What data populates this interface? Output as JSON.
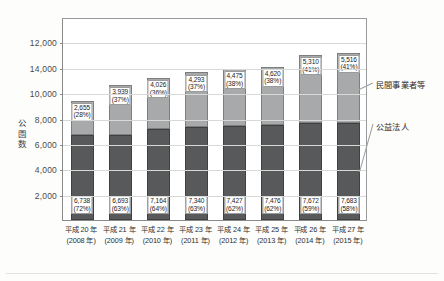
{
  "chart_data": {
    "type": "bar",
    "subtype": "stacked-vertical",
    "title": "",
    "xlabel": "",
    "ylabel": "公園数",
    "ylim": [
      0,
      16000
    ],
    "grid": true,
    "legend_position": "right",
    "ytick_labels": [
      "2,000",
      "4,000",
      "6,000",
      "8,000",
      "10,000",
      "14,000",
      "12,000"
    ],
    "ytick_values": [
      2000,
      4000,
      6000,
      8000,
      10000,
      12000,
      14000
    ],
    "categories": [
      "平成 20 年",
      "平成 21 年",
      "平成 22 年",
      "平成 23 年",
      "平成 24 年",
      "平成 25 年",
      "平成 26 年",
      "平成 27 年"
    ],
    "categories_sub": [
      "(2008 年)",
      "(2009 年)",
      "(2010 年)",
      "(2011 年)",
      "(2012 年)",
      "(2013 年)",
      "(2014 年)",
      "(2015 年)"
    ],
    "series": [
      {
        "name": "公益法人",
        "color": "#58595b",
        "values": [
          6738,
          6693,
          7164,
          7340,
          7427,
          7476,
          7672,
          7683
        ],
        "labels": [
          "6,738",
          "6,693",
          "7,164",
          "7,340",
          "7,427",
          "7,476",
          "7,672",
          "7,683"
        ],
        "pct_labels": [
          "(72%)",
          "(63%)",
          "(64%)",
          "(63%)",
          "(62%)",
          "(62%)",
          "(59%)",
          "(58%)"
        ]
      },
      {
        "name": "民間事業者等",
        "color": "#a8a9ab",
        "values": [
          2655,
          3939,
          4026,
          4293,
          4475,
          4620,
          5310,
          5516
        ],
        "labels": [
          "2,655",
          "3,939",
          "4,026",
          "4,293",
          "4,475",
          "4,620",
          "5,310",
          "5,516"
        ],
        "pct_labels": [
          "(28%)",
          "(37%)",
          "(36%)",
          "(37%)",
          "(38%)",
          "(38%)",
          "(41%)",
          "(41%)"
        ]
      }
    ],
    "totals": [
      9393,
      10632,
      11190,
      11633,
      11902,
      12096,
      12982,
      13199
    ]
  },
  "legend": {
    "upper_label": "民間事業者等",
    "lower_label": "公益法人"
  }
}
